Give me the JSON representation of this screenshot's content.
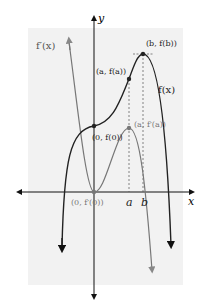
{
  "diagram": {
    "type": "function-and-derivative-graph",
    "axes": {
      "x_label": "x",
      "y_label": "y"
    },
    "curves": [
      {
        "name": "f",
        "label": "f(x)",
        "color": "#222222"
      },
      {
        "name": "f_prime",
        "label": "f′(x)",
        "color": "#777777"
      }
    ],
    "points": [
      {
        "id": "b_fb",
        "label": "(b, f(b))"
      },
      {
        "id": "a_fa",
        "label": "(a, f(a))"
      },
      {
        "id": "zero_f0",
        "label": "(0, f(0))"
      },
      {
        "id": "a_fpa",
        "label": "(a, f′(a))"
      },
      {
        "id": "zero_fp0",
        "label": "(0, f′(0))"
      }
    ],
    "x_ticks": [
      {
        "id": "a",
        "label": "a"
      },
      {
        "id": "b",
        "label": "b"
      }
    ],
    "colors": {
      "background_panel": "#f2f2f2",
      "f_curve": "#222222",
      "f_prime_curve": "#777777",
      "axis": "#111111"
    }
  }
}
